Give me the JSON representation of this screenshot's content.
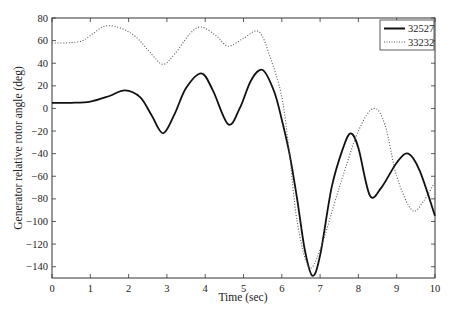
{
  "chart_data": {
    "type": "line",
    "title": "",
    "xlabel": "Time (sec)",
    "ylabel": "Generator relative rotor angle (deg)",
    "xlim": [
      0,
      10
    ],
    "ylim": [
      -150,
      80
    ],
    "xticks": [
      0,
      1,
      2,
      3,
      4,
      5,
      6,
      7,
      8,
      9,
      10
    ],
    "yticks": [
      80,
      60,
      40,
      20,
      0,
      -20,
      -40,
      -60,
      -80,
      -100,
      -120,
      -140
    ],
    "grid": false,
    "legend_position": "upper right",
    "series": [
      {
        "name": "32527",
        "style": "solid",
        "x": [
          0,
          0.5,
          1.0,
          1.5,
          1.9,
          2.3,
          2.6,
          2.9,
          3.2,
          3.5,
          3.9,
          4.2,
          4.6,
          4.9,
          5.2,
          5.5,
          5.8,
          6.0,
          6.2,
          6.4,
          6.6,
          6.8,
          7.0,
          7.3,
          7.6,
          7.8,
          8.0,
          8.3,
          8.6,
          9.0,
          9.3,
          9.6,
          10.0
        ],
        "values": [
          5,
          5,
          6,
          11,
          16,
          10,
          -6,
          -22,
          -5,
          18,
          31,
          16,
          -14,
          0,
          25,
          34,
          15,
          -10,
          -40,
          -80,
          -125,
          -148,
          -130,
          -70,
          -35,
          -22,
          -35,
          -77,
          -70,
          -48,
          -40,
          -55,
          -95
        ]
      },
      {
        "name": "33232",
        "style": "dotted",
        "x": [
          0,
          0.4,
          0.8,
          1.1,
          1.4,
          1.8,
          2.2,
          2.6,
          2.9,
          3.2,
          3.6,
          3.9,
          4.3,
          4.6,
          5.0,
          5.4,
          5.7,
          6.0,
          6.2,
          6.4,
          6.7,
          7.0,
          7.5,
          8.0,
          8.4,
          8.7,
          9.0,
          9.4,
          9.7,
          10.0
        ],
        "values": [
          58,
          58,
          60,
          67,
          73,
          71,
          63,
          48,
          39,
          48,
          66,
          72,
          64,
          55,
          62,
          68,
          45,
          10,
          -40,
          -100,
          -140,
          -125,
          -70,
          -20,
          0,
          -15,
          -60,
          -90,
          -82,
          -65
        ]
      }
    ]
  }
}
